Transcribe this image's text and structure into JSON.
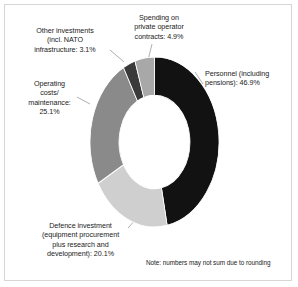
{
  "chart_data": {
    "type": "pie",
    "variant": "donut",
    "title": "",
    "subtitle": "",
    "xlabel": "",
    "ylabel": "",
    "units": "percent",
    "start_angle_deg": 0,
    "direction": "clockwise",
    "inner_radius_ratio": 0.55,
    "legend": "none",
    "grid": false,
    "categories": [
      "Personnel (including pensions)",
      "Defence investment (equipment procurement plus research and development)",
      "Operating costs/maintenance",
      "Other investments (incl. NATO infrastructure",
      "Spending on private operator contracts"
    ],
    "values": [
      46.9,
      20.1,
      25.1,
      3.1,
      4.9
    ],
    "colors": [
      "#121212",
      "#cfcfcf",
      "#8a8a8a",
      "#3a3a3a",
      "#a8a8a8"
    ],
    "total": 100.1,
    "annotations": [
      "Note: numbers may not sum due to rounding"
    ]
  },
  "chart": {
    "slices": [
      {
        "name": "personnel",
        "label": "Personnel (including\npensions): 46.9%",
        "value": 46.9,
        "value_text": "46.9%",
        "color": "#121212"
      },
      {
        "name": "defence-investment",
        "label": "Defence investment\n(equipment procurement\nplus research and\ndevelopment): 20.1%",
        "value": 20.1,
        "value_text": "20.1%",
        "color": "#cfcfcf"
      },
      {
        "name": "operating-costs",
        "label": "Operating\ncosts/\nmaintenance:\n25.1%",
        "value": 25.1,
        "value_text": "25.1%",
        "color": "#8a8a8a"
      },
      {
        "name": "other-investments",
        "label": "Other investments\n(incl. NATO\ninfrastructure: 3.1%",
        "value": 3.1,
        "value_text": "3.1%",
        "color": "#3a3a3a"
      },
      {
        "name": "private-operator-contracts",
        "label": "Spending on\nprivate operator\ncontracts: 4.9%",
        "value": 4.9,
        "value_text": "4.9%",
        "color": "#a8a8a8"
      }
    ],
    "note": "Note: numbers may not sum due to rounding"
  },
  "style": {
    "background": "#ffffff",
    "border_color": "#d6d6d6",
    "text_color": "#1b1b1b",
    "leader_color": "#8d8d8d"
  }
}
